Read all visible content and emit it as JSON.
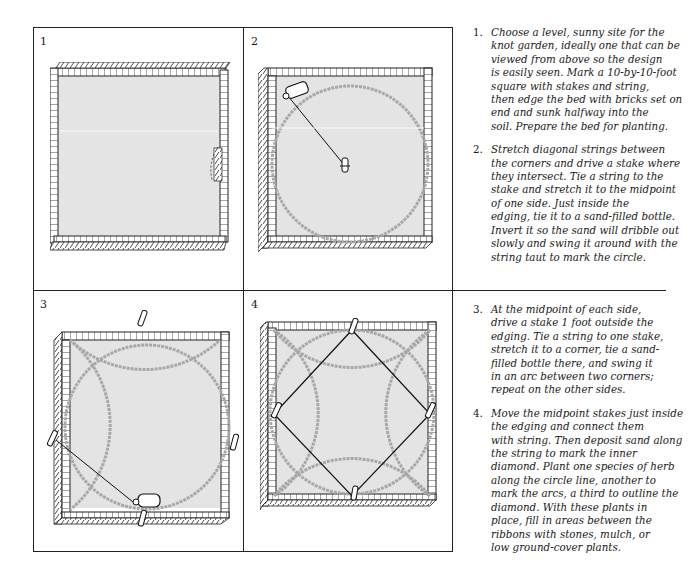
{
  "panels": [
    {
      "number": "1",
      "caption": "Square bed edged with bricks"
    },
    {
      "number": "2",
      "caption": "Circle marked with sand-filled bottle"
    },
    {
      "number": "3",
      "caption": "Arcs swung from midpoint stakes"
    },
    {
      "number": "4",
      "caption": "Inner diamond strung between stakes"
    }
  ],
  "steps": [
    {
      "number": "1.",
      "text": "Choose a level, sunny site for the\nknot garden, ideally one that can be\nviewed from above so the design\nis easily seen. Mark a 10-by-10-foot\nsquare with stakes and string,\nthen edge the bed with bricks set on\nend and sunk halfway into the\nsoil. Prepare the bed for planting."
    },
    {
      "number": "2.",
      "text": "Stretch diagonal strings between\nthe corners and drive a stake where\nthey intersect. Tie a string to the\nstake and stretch it to the midpoint\nof one side. Just inside the\nedging, tie it to a sand-filled bottle.\nInvert it so the sand will dribble out\nslowly and swing it around with the\nstring taut to mark the circle."
    },
    {
      "number": "3.",
      "text": "At the midpoint of each side,\ndrive a stake 1 foot outside the\nedging. Tie a string to one stake,\nstretch it to a corner, tie a sand-\nfilled bottle there, and swing it\nin an arc between two corners;\nrepeat on the other sides."
    },
    {
      "number": "4.",
      "text": "Move the midpoint stakes just inside\nthe edging and connect them\nwith string. Then deposit sand along\nthe string to mark the inner\ndiamond. Plant one species of herb\nalong the circle line, another to\nmark the arcs, a third to outline the\ndiamond. With these plants in\nplace, fill in areas between the\nribbons with stones, mulch, or\nlow ground-cover plants."
    }
  ],
  "colors": {
    "ink": "#1a1a1a",
    "bed_fill": "#e4e4e4",
    "sand_line": "#a8a8a8"
  }
}
